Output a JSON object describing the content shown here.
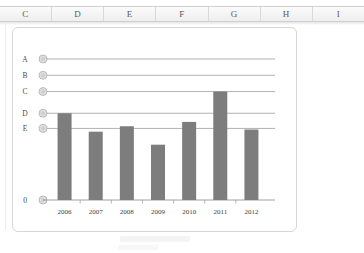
{
  "spreadsheet": {
    "column_headers": [
      "C",
      "D",
      "E",
      "F",
      "G",
      "H",
      "I"
    ]
  },
  "chart_data": {
    "type": "bar",
    "title": "",
    "xlabel": "",
    "ylabel": "",
    "categories": [
      "2006",
      "2007",
      "2008",
      "2009",
      "2010",
      "2011",
      "2012"
    ],
    "values": [
      4.0,
      3.15,
      3.4,
      2.55,
      3.6,
      5.0,
      3.25
    ],
    "y_tick_labels": [
      "A",
      "B",
      "C",
      "D",
      "E",
      "0"
    ],
    "y_tick_values": [
      6.5,
      5.75,
      5.0,
      4.0,
      3.3,
      0
    ],
    "ylim": [
      0,
      7.1
    ],
    "grid": true,
    "legend": "none",
    "series": [
      {
        "name": "",
        "values": [
          4.0,
          3.15,
          3.4,
          2.55,
          3.6,
          5.0,
          3.25
        ]
      }
    ],
    "bar_color": "#7d7d7d",
    "gridline_color": "#909090",
    "marker_color": "#cfcfcf"
  }
}
